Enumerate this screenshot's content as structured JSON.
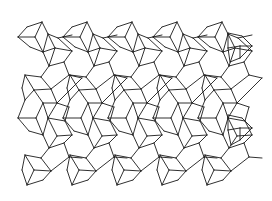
{
  "figure": {
    "stroke_color": "#1a1a1a",
    "background_color": "#ffffff",
    "tile": {
      "period_x": 45,
      "rows": [
        {
          "offset_y": 0,
          "segments": [
            [
              18,
              37,
              27,
              27
            ],
            [
              27,
              27,
              42,
              22
            ],
            [
              42,
              22,
              48,
              34
            ],
            [
              48,
              34,
              43,
              52
            ],
            [
              43,
              52,
              30,
              47
            ],
            [
              30,
              47,
              18,
              37
            ],
            [
              35,
              37,
              18,
              37
            ],
            [
              35,
              37,
              42,
              22
            ],
            [
              35,
              37,
              43,
              52
            ],
            [
              48,
              34,
              58,
              38
            ],
            [
              58,
              38,
              72,
              35
            ],
            [
              48,
              34,
              55,
              48
            ],
            [
              55,
              48,
              43,
              52
            ],
            [
              55,
              48,
              72,
              51
            ],
            [
              72,
              51,
              58,
              38
            ],
            [
              43,
              52,
              49,
              66
            ],
            [
              49,
              66,
              55,
              48
            ],
            [
              49,
              66,
              64,
              62
            ],
            [
              64,
              62,
              72,
              51
            ]
          ]
        },
        {
          "offset_y": 0,
          "segments": [
            [
              64,
              62,
              69,
              75
            ],
            [
              69,
              75,
              82,
              78
            ],
            [
              49,
              66,
              41,
              77
            ],
            [
              41,
              77,
              25,
              75
            ],
            [
              41,
              77,
              51,
              89
            ],
            [
              51,
              89,
              69,
              75
            ],
            [
              51,
              89,
              57,
              103
            ],
            [
              57,
              103,
              69,
              91
            ],
            [
              69,
              91,
              82,
              78
            ],
            [
              25,
              75,
              34,
              90
            ],
            [
              34,
              90,
              51,
              89
            ],
            [
              34,
              90,
              25,
              100
            ],
            [
              25,
              100,
              22,
              88
            ],
            [
              22,
              88,
              25,
              75
            ],
            [
              34,
              90,
              43,
              103
            ],
            [
              43,
              103,
              57,
              103
            ]
          ]
        },
        {
          "offset_y": 0,
          "segments": [
            [
              25,
              100,
              18,
              118
            ],
            [
              18,
              118,
              29,
              131
            ],
            [
              29,
              131,
              43,
              135
            ],
            [
              43,
              135,
              48,
              118
            ],
            [
              48,
              118,
              43,
              103
            ],
            [
              43,
              103,
              36,
              118
            ],
            [
              36,
              118,
              18,
              118
            ],
            [
              36,
              118,
              43,
              135
            ],
            [
              48,
              118,
              57,
              103
            ],
            [
              48,
              118,
              65,
              121
            ],
            [
              65,
              121,
              69,
              107
            ],
            [
              69,
              107,
              57,
              103
            ],
            [
              65,
              121,
              72,
              135
            ],
            [
              72,
              135,
              57,
              136
            ],
            [
              57,
              136,
              48,
              118
            ],
            [
              43,
              135,
              49,
              148
            ],
            [
              49,
              148,
              57,
              136
            ],
            [
              49,
              148,
              64,
              143
            ],
            [
              64,
              143,
              72,
              135
            ]
          ]
        },
        {
          "offset_y": 0,
          "segments": [
            [
              64,
              143,
              69,
              157
            ],
            [
              69,
              157,
              82,
              158
            ],
            [
              49,
              148,
              41,
              158
            ],
            [
              41,
              158,
              25,
              155
            ],
            [
              41,
              158,
              51,
              171
            ],
            [
              51,
              171,
              69,
              157
            ],
            [
              25,
              155,
              34,
              170
            ],
            [
              34,
              170,
              51,
              171
            ],
            [
              34,
              170,
              27,
              185
            ],
            [
              27,
              185,
              22,
              170
            ],
            [
              22,
              170,
              25,
              155
            ],
            [
              27,
              185,
              43,
              180
            ],
            [
              43,
              180,
              51,
              171
            ]
          ]
        }
      ]
    },
    "repeat_count_x": 5,
    "extra_right_cubes": [
      {
        "segments": [
          [
            228,
            33,
            242,
            36
          ],
          [
            242,
            36,
            252,
            46
          ],
          [
            252,
            46,
            240,
            58
          ],
          [
            240,
            58,
            230,
            62
          ],
          [
            230,
            62,
            228,
            48
          ],
          [
            228,
            48,
            228,
            33
          ],
          [
            228,
            48,
            240,
            46
          ],
          [
            240,
            46,
            252,
            46
          ],
          [
            240,
            46,
            240,
            58
          ]
        ]
      },
      {
        "segments": [
          [
            228,
            115,
            242,
            118
          ],
          [
            242,
            118,
            252,
            128
          ],
          [
            252,
            128,
            240,
            140
          ],
          [
            240,
            140,
            231,
            145
          ],
          [
            231,
            145,
            228,
            130
          ],
          [
            228,
            130,
            228,
            115
          ],
          [
            228,
            130,
            240,
            128
          ],
          [
            240,
            128,
            252,
            128
          ],
          [
            240,
            128,
            240,
            140
          ]
        ]
      }
    ]
  }
}
